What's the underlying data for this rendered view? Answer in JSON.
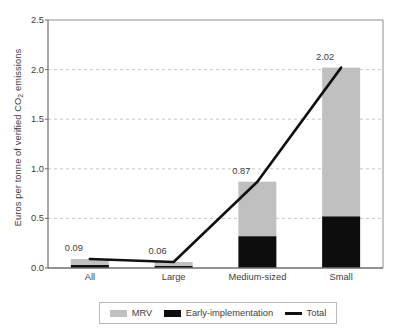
{
  "chart_data": {
    "type": "bar",
    "title": "",
    "subtitle": "",
    "xlabel": "",
    "ylabel": "Euros per tonne of verified CO2 emissions",
    "ylabel_parts": {
      "before": "Euros per tonne of verified CO",
      "sub": "2",
      "after": " emissions"
    },
    "categories": [
      "All",
      "Large",
      "Medium-sized",
      "Small"
    ],
    "ylim": [
      0.0,
      2.5
    ],
    "yticks": [
      "0.0",
      "0.5",
      "1.0",
      "1.5",
      "2.0",
      "2.5"
    ],
    "ytick_values": [
      0.0,
      0.5,
      1.0,
      1.5,
      2.0,
      2.5
    ],
    "grid": "horizontal-dashed",
    "legend_position": "bottom",
    "stacked": true,
    "series": [
      {
        "name": "MRV",
        "kind": "bar",
        "color": "#c0c0c0",
        "values": [
          0.06,
          0.04,
          0.55,
          1.5
        ]
      },
      {
        "name": "Early-implementation",
        "kind": "bar",
        "color": "#0d0d0d",
        "values": [
          0.03,
          0.02,
          0.32,
          0.52
        ]
      },
      {
        "name": "Total",
        "kind": "line",
        "color": "#111111",
        "values": [
          0.09,
          0.06,
          0.87,
          2.02
        ]
      }
    ],
    "data_labels": [
      "0.09",
      "0.06",
      "0.87",
      "2.02"
    ]
  },
  "legend": {
    "items": [
      {
        "label": "MRV",
        "marker": "box",
        "color": "#c0c0c0"
      },
      {
        "label": "Early-implementation",
        "marker": "box",
        "color": "#0d0d0d"
      },
      {
        "label": "Total",
        "marker": "line",
        "color": "#111111"
      }
    ]
  }
}
